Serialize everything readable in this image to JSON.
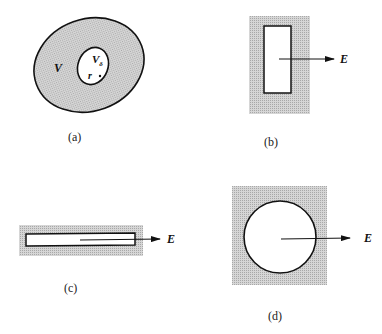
{
  "figure": {
    "panels": [
      {
        "id": "a",
        "caption": "(a)",
        "shape": "ellipse-with-cavity",
        "outer_label": "V",
        "cavity_label": "V",
        "cavity_label_subscript": "δ",
        "point_label": "r"
      },
      {
        "id": "b",
        "caption": "(b)",
        "shape": "tall-rectangular-cavity",
        "field_label": "E"
      },
      {
        "id": "c",
        "caption": "(c)",
        "shape": "thin-slot-cavity",
        "field_label": "E"
      },
      {
        "id": "d",
        "caption": "(d)",
        "shape": "circular-cavity",
        "field_label": "E"
      }
    ],
    "colors": {
      "fill_shaded": "#c9c9c9",
      "stroke": "#111111",
      "cavity": "#ffffff"
    }
  }
}
